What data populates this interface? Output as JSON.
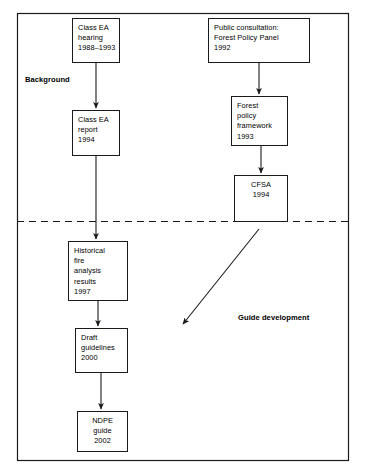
{
  "diagram": {
    "background_color": "#ffffff",
    "line_color": "#1a1a1a",
    "border": {
      "x": 17,
      "y": 13,
      "width": 331,
      "height": 447
    },
    "divider": {
      "kind": "dashed-horizontal-line",
      "y": 221,
      "x1": 17,
      "x2": 348,
      "dash": "7,5"
    },
    "sections": [
      {
        "id": "background",
        "label": "Background",
        "x": 25,
        "y": 75,
        "bold": true
      },
      {
        "id": "guide-development",
        "label": "Guide development",
        "x": 238,
        "y": 313,
        "bold": true
      }
    ],
    "nodes": [
      {
        "id": "class-ea-hearing",
        "text": "Class EA\nhearing\n1988–1993",
        "x": 72,
        "y": 18,
        "width": 48,
        "height": 45,
        "align": "left"
      },
      {
        "id": "public-consultation",
        "text": "Public consultation:\nForest Policy Panel\n1992",
        "x": 208,
        "y": 18,
        "width": 102,
        "height": 45,
        "align": "left"
      },
      {
        "id": "class-ea-report",
        "text": "Class EA\nreport\n1994",
        "x": 72,
        "y": 110,
        "width": 48,
        "height": 46,
        "align": "left"
      },
      {
        "id": "forest-policy-framework",
        "text": "Forest\npolicy\nframework\n1993",
        "x": 231,
        "y": 96,
        "width": 57,
        "height": 50,
        "align": "left"
      },
      {
        "id": "cfsa",
        "text": "CFSA\n1994",
        "x": 234,
        "y": 175,
        "width": 54,
        "height": 47,
        "align": "center"
      },
      {
        "id": "historical-fire-analysis",
        "text": "Historical\nfire\nanalysis\nresults\n1997",
        "x": 68,
        "y": 241,
        "width": 60,
        "height": 60,
        "align": "left"
      },
      {
        "id": "draft-guidelines",
        "text": "Draft\nguidelines\n2000",
        "x": 75,
        "y": 328,
        "width": 53,
        "height": 45,
        "align": "left"
      },
      {
        "id": "ndpe-guide",
        "text": "NDPE\nguide\n2002",
        "x": 77,
        "y": 411,
        "width": 51,
        "height": 41,
        "align": "center"
      }
    ],
    "connectors": [
      {
        "id": "hearing-to-report",
        "from": "class-ea-hearing",
        "to": "class-ea-report",
        "x1": 96,
        "y1": 63,
        "x2": 96,
        "y2": 108,
        "arrowhead": true
      },
      {
        "id": "consultation-to-framework",
        "from": "public-consultation",
        "to": "forest-policy-framework",
        "x1": 259,
        "y1": 63,
        "x2": 259,
        "y2": 94,
        "arrowhead": true
      },
      {
        "id": "framework-to-cfsa",
        "from": "forest-policy-framework",
        "to": "cfsa",
        "x1": 261,
        "y1": 146,
        "x2": 261,
        "y2": 173,
        "arrowhead": true
      },
      {
        "id": "report-to-historical",
        "from": "class-ea-report",
        "to": "historical-fire-analysis",
        "x1": 96,
        "y1": 156,
        "x2": 96,
        "y2": 239,
        "arrowhead": true
      },
      {
        "id": "cfsa-to-guide-development",
        "from": "cfsa",
        "to": "guide-development",
        "x1": 259,
        "y1": 229,
        "x2": 183,
        "y2": 324,
        "arrowhead": true,
        "diagonal": true
      },
      {
        "id": "historical-to-draft",
        "from": "historical-fire-analysis",
        "to": "draft-guidelines",
        "x1": 98,
        "y1": 301,
        "x2": 98,
        "y2": 326,
        "arrowhead": true
      },
      {
        "id": "draft-to-ndpe",
        "from": "draft-guidelines",
        "to": "ndpe-guide",
        "x1": 101,
        "y1": 373,
        "x2": 101,
        "y2": 409,
        "arrowhead": true
      }
    ]
  }
}
